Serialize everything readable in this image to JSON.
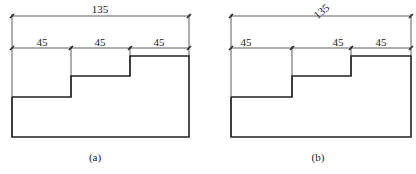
{
  "figures": [
    {
      "id": "a",
      "caption": "(a)",
      "overall_dimension": {
        "label": "135",
        "text_orientation": "horizontal"
      },
      "segment_dimensions": [
        {
          "label": "45",
          "position": "centered"
        },
        {
          "label": "45",
          "position": "centered"
        },
        {
          "label": "45",
          "position": "centered"
        }
      ]
    },
    {
      "id": "b",
      "caption": "(b)",
      "overall_dimension": {
        "label": "135",
        "text_orientation": "rotated"
      },
      "segment_dimensions": [
        {
          "label": "45",
          "position": "left"
        },
        {
          "label": "45",
          "position": "right"
        },
        {
          "label": "45",
          "position": "centered"
        }
      ]
    }
  ]
}
